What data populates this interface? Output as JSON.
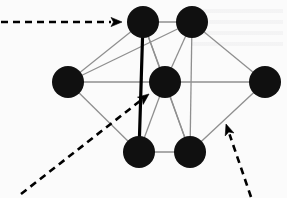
{
  "figure": {
    "type": "graph-diagram",
    "title": "",
    "background_color": "#fbfbfb",
    "canvas": {
      "width": 287,
      "height": 198
    }
  },
  "style": {
    "node_fill": "#101010",
    "node_radius": 16,
    "edge_color": "#8f8f8f",
    "edge_width": 1.3,
    "highlight_edge_color": "#000000",
    "highlight_edge_width": 3.2,
    "annotation_color": "#000000",
    "annotation_width": 2.6,
    "annotation_dash": "7 5"
  },
  "chart_data": {
    "type": "scatter",
    "title": "",
    "xlabel": "",
    "ylabel": "",
    "nodes": [
      {
        "id": "n1",
        "label": "top-left",
        "x": 143,
        "y": 22,
        "r": 16
      },
      {
        "id": "n2",
        "label": "top-right",
        "x": 192,
        "y": 22,
        "r": 16
      },
      {
        "id": "n3",
        "label": "left",
        "x": 68,
        "y": 82,
        "r": 16
      },
      {
        "id": "n4",
        "label": "center",
        "x": 165,
        "y": 82,
        "r": 16
      },
      {
        "id": "n5",
        "label": "right",
        "x": 265,
        "y": 82,
        "r": 16
      },
      {
        "id": "n6",
        "label": "bottom-left",
        "x": 139,
        "y": 152,
        "r": 16
      },
      {
        "id": "n7",
        "label": "bottom-right",
        "x": 190,
        "y": 152,
        "r": 16
      }
    ],
    "edges": [
      {
        "from": "n1",
        "to": "n2",
        "highlight": false
      },
      {
        "from": "n1",
        "to": "n3",
        "highlight": false
      },
      {
        "from": "n1",
        "to": "n4",
        "highlight": false
      },
      {
        "from": "n1",
        "to": "n7",
        "highlight": false
      },
      {
        "from": "n1",
        "to": "n6",
        "highlight": true
      },
      {
        "from": "n2",
        "to": "n3",
        "highlight": false
      },
      {
        "from": "n2",
        "to": "n4",
        "highlight": false
      },
      {
        "from": "n2",
        "to": "n5",
        "highlight": false
      },
      {
        "from": "n2",
        "to": "n7",
        "highlight": false
      },
      {
        "from": "n3",
        "to": "n4",
        "highlight": false
      },
      {
        "from": "n3",
        "to": "n6",
        "highlight": false
      },
      {
        "from": "n4",
        "to": "n5",
        "highlight": false
      },
      {
        "from": "n4",
        "to": "n6",
        "highlight": false
      },
      {
        "from": "n4",
        "to": "n7",
        "highlight": false
      },
      {
        "from": "n5",
        "to": "n7",
        "highlight": false
      },
      {
        "from": "n6",
        "to": "n7",
        "highlight": false
      }
    ],
    "annotations": [
      {
        "id": "a1",
        "label": "",
        "kind": "dashed-arrow",
        "target": "n1",
        "x1": 1,
        "y1": 22,
        "x2": 122,
        "y2": 22
      },
      {
        "id": "a2",
        "label": "",
        "kind": "dashed-arrow",
        "target": "n4",
        "x1": 21,
        "y1": 194,
        "x2": 149,
        "y2": 94
      },
      {
        "id": "a3",
        "label": "",
        "kind": "dashed-arrow",
        "target": "edge n5-n7",
        "x1": 251,
        "y1": 197,
        "x2": 226,
        "y2": 124
      }
    ],
    "legend": [],
    "grid": false
  }
}
